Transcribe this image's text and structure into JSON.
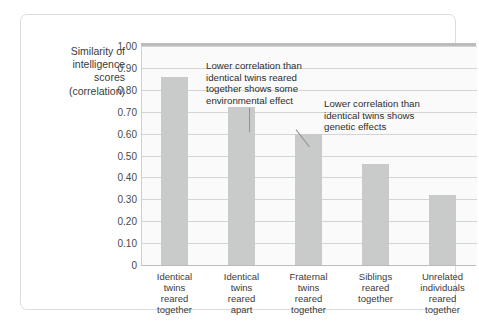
{
  "y_axis": {
    "title_lines": [
      "Similarity of",
      "intelligence",
      "scores",
      "(correlation)"
    ],
    "tick_labels": [
      "1.00",
      "0.90",
      "0.80",
      "0.70",
      "0.60",
      "0.50",
      "0.40",
      "0.30",
      "0.20",
      "0.10",
      "0"
    ]
  },
  "annotations": [
    {
      "id": "environmental-effect-note",
      "lines": [
        "Lower correlation than",
        "identical twins reared",
        "together shows some",
        "environmental effect"
      ],
      "points_to": "Identical twins reared apart"
    },
    {
      "id": "genetic-effect-note",
      "lines": [
        "Lower correlation than",
        "identical twins shows",
        "genetic effects"
      ],
      "points_to": "Fraternal twins reared together"
    }
  ],
  "x_labels": [
    [
      "Identical",
      "twins",
      "reared",
      "together"
    ],
    [
      "Identical",
      "twins",
      "reared",
      "apart"
    ],
    [
      "Fraternal",
      "twins",
      "reared",
      "together"
    ],
    [
      "Siblings",
      "reared",
      "together"
    ],
    [
      "Unrelated",
      "individuals",
      "reared",
      "together"
    ]
  ],
  "colors": {
    "bar_fill": "#c9cbcb",
    "plot_background": "#fafafa",
    "gridline": "#d3d5d4",
    "axis_rule": "#b9bcbb",
    "card_border": "#dcdedd",
    "text": "#3a3a3a"
  },
  "chart_data": {
    "type": "bar",
    "title": "",
    "xlabel": "",
    "ylabel": "Similarity of intelligence scores (correlation)",
    "ylim": [
      0,
      1.0
    ],
    "ytick_values": [
      1.0,
      0.9,
      0.8,
      0.7,
      0.6,
      0.5,
      0.4,
      0.3,
      0.2,
      0.1,
      0
    ],
    "grid": true,
    "legend_position": "none",
    "categories": [
      "Identical twins reared together",
      "Identical twins reared apart",
      "Fraternal twins reared together",
      "Siblings reared together",
      "Unrelated individuals reared together"
    ],
    "values": [
      0.86,
      0.72,
      0.6,
      0.46,
      0.32
    ],
    "annotations": [
      "Lower correlation than identical twins reared together shows some environmental effect",
      "Lower correlation than identical twins shows genetic effects"
    ]
  }
}
